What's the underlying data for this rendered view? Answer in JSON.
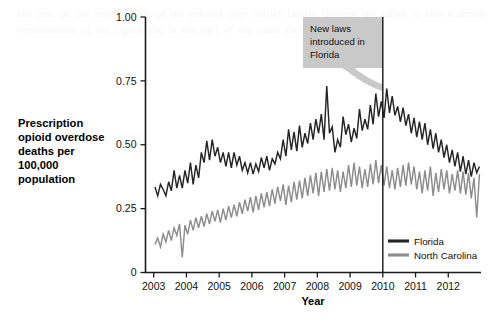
{
  "figure": {
    "background_color": "#ffffff",
    "ink_color": "#1b1b1b"
  },
  "chart_data": {
    "type": "line",
    "title": "",
    "xlabel": "Year",
    "ylabel": "Prescription opioid overdose deaths per 100,000 population",
    "ylabel_lines": [
      "Prescription",
      "opioid overdose",
      "deaths per",
      "100,000",
      "population"
    ],
    "xlim": [
      2002.75,
      2013.0
    ],
    "ylim": [
      0,
      1.0
    ],
    "grid": false,
    "y_ticks": [
      0,
      0.25,
      0.5,
      0.75,
      1.0
    ],
    "y_tick_labels": [
      "0",
      "0.25",
      "0.50",
      "0.75",
      "1.00"
    ],
    "x_ticks": [
      2003,
      2004,
      2005,
      2006,
      2007,
      2008,
      2009,
      2010,
      2011,
      2012
    ],
    "x_tick_labels": [
      "2003",
      "2004",
      "2005",
      "2006",
      "2007",
      "2008",
      "2009",
      "2010",
      "2011",
      "2012"
    ],
    "legend_position": "bottom-right",
    "annotations": [
      {
        "text": "New laws introduced in Florida",
        "text_lines": [
          "New laws",
          "introduced in",
          "Florida"
        ],
        "box_color": "#c9c9c9",
        "points_to_x": 2010,
        "kind": "callout"
      }
    ],
    "reference_lines": [
      {
        "orientation": "vertical",
        "x": 2010,
        "color": "#141414"
      }
    ],
    "series": [
      {
        "name": "Florida",
        "color": "#252525",
        "x_start": 2003.04,
        "x_step": 0.0833,
        "values": [
          0.335,
          0.3,
          0.345,
          0.325,
          0.3,
          0.355,
          0.32,
          0.4,
          0.33,
          0.38,
          0.33,
          0.4,
          0.35,
          0.43,
          0.345,
          0.42,
          0.37,
          0.47,
          0.43,
          0.515,
          0.44,
          0.52,
          0.455,
          0.49,
          0.43,
          0.47,
          0.415,
          0.47,
          0.41,
          0.47,
          0.42,
          0.455,
          0.4,
          0.43,
          0.39,
          0.43,
          0.385,
          0.425,
          0.395,
          0.45,
          0.41,
          0.455,
          0.4,
          0.445,
          0.425,
          0.47,
          0.445,
          0.52,
          0.455,
          0.56,
          0.48,
          0.55,
          0.475,
          0.575,
          0.49,
          0.545,
          0.505,
          0.585,
          0.52,
          0.6,
          0.545,
          0.62,
          0.52,
          0.73,
          0.545,
          0.57,
          0.47,
          0.52,
          0.49,
          0.61,
          0.54,
          0.58,
          0.51,
          0.565,
          0.525,
          0.64,
          0.555,
          0.6,
          0.56,
          0.655,
          0.58,
          0.7,
          0.61,
          0.67,
          0.605,
          0.72,
          0.625,
          0.69,
          0.615,
          0.65,
          0.59,
          0.645,
          0.575,
          0.62,
          0.545,
          0.605,
          0.53,
          0.59,
          0.52,
          0.585,
          0.5,
          0.56,
          0.485,
          0.545,
          0.47,
          0.52,
          0.45,
          0.5,
          0.43,
          0.48,
          0.415,
          0.47,
          0.395,
          0.455,
          0.385,
          0.44,
          0.375,
          0.43,
          0.39,
          0.415
        ]
      },
      {
        "name": "North Carolina",
        "color": "#8d8d8d",
        "x_start": 2003.04,
        "x_step": 0.0833,
        "values": [
          0.11,
          0.135,
          0.1,
          0.15,
          0.12,
          0.165,
          0.125,
          0.175,
          0.145,
          0.19,
          0.06,
          0.185,
          0.15,
          0.205,
          0.165,
          0.215,
          0.175,
          0.22,
          0.18,
          0.23,
          0.19,
          0.24,
          0.2,
          0.245,
          0.195,
          0.25,
          0.205,
          0.26,
          0.215,
          0.265,
          0.22,
          0.275,
          0.23,
          0.285,
          0.24,
          0.295,
          0.235,
          0.3,
          0.245,
          0.31,
          0.255,
          0.315,
          0.26,
          0.325,
          0.27,
          0.335,
          0.28,
          0.345,
          0.265,
          0.34,
          0.275,
          0.355,
          0.285,
          0.36,
          0.29,
          0.37,
          0.3,
          0.38,
          0.31,
          0.39,
          0.3,
          0.395,
          0.315,
          0.405,
          0.32,
          0.41,
          0.325,
          0.4,
          0.315,
          0.395,
          0.33,
          0.42,
          0.335,
          0.43,
          0.34,
          0.415,
          0.33,
          0.405,
          0.335,
          0.425,
          0.345,
          0.44,
          0.35,
          0.42,
          0.34,
          0.415,
          0.33,
          0.4,
          0.325,
          0.41,
          0.335,
          0.42,
          0.34,
          0.43,
          0.345,
          0.415,
          0.325,
          0.395,
          0.31,
          0.4,
          0.32,
          0.415,
          0.3,
          0.39,
          0.315,
          0.405,
          0.325,
          0.4,
          0.31,
          0.385,
          0.32,
          0.4,
          0.31,
          0.395,
          0.305,
          0.39,
          0.29,
          0.37,
          0.215,
          0.385
        ]
      }
    ]
  },
  "legend": {
    "items": [
      {
        "label": "Florida",
        "color": "#252525"
      },
      {
        "label": "North Carolina",
        "color": "#8d8d8d"
      }
    ]
  },
  "page_bleed_text": "the text on the reverse side of the printed page shows faintly through the paper in this scanned reproduction of the figure and is not part of the chart itself"
}
